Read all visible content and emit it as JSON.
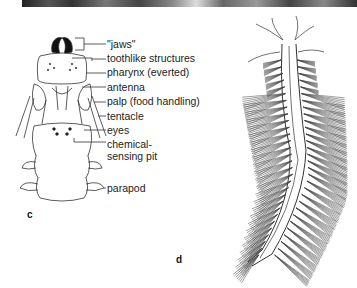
{
  "photo_strip": {
    "description": "photograph strip (cropped)"
  },
  "panel_c": {
    "letter": "c",
    "labels": [
      "\"jaws\"",
      "toothlike structures",
      "pharynx (everted)",
      "antenna",
      "palp (food handling)",
      "tentacle",
      "eyes",
      "chemical-",
      "sensing pit",
      "parapod"
    ]
  },
  "panel_d": {
    "letter": "d"
  },
  "colors": {
    "line": "#333333",
    "jaw": "#111111",
    "text": "#222222"
  }
}
